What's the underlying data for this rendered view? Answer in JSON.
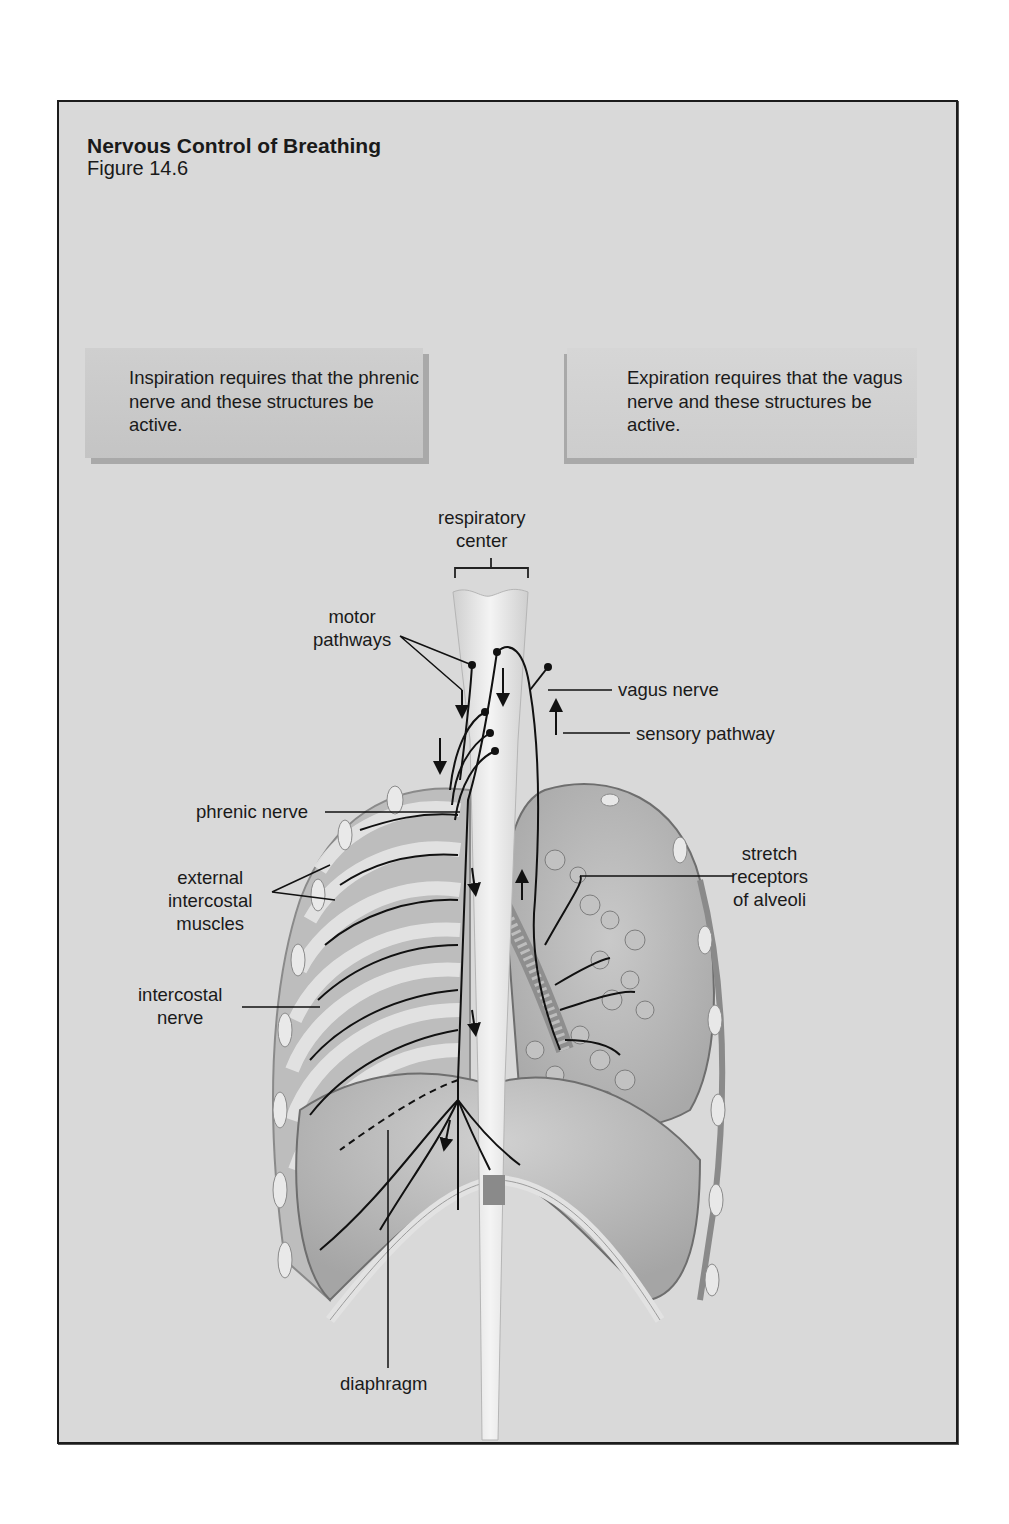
{
  "figure": {
    "title": "Nervous Control of Breathing",
    "subtitle": "Figure 14.6"
  },
  "callouts": {
    "inspiration": "Inspiration requires that the phrenic nerve and these structures be active.",
    "expiration": "Expiration requires that the vagus nerve and these structures be active."
  },
  "labels": {
    "respiratory_center": [
      "respiratory",
      "center"
    ],
    "motor_pathways": [
      "motor",
      "pathways"
    ],
    "vagus_nerve": "vagus nerve",
    "sensory_pathway": "sensory pathway",
    "phrenic_nerve": "phrenic nerve",
    "stretch_receptors": [
      "stretch",
      "receptors",
      "of alveoli"
    ],
    "external_intercostal_muscles": [
      "external",
      "intercostal",
      "muscles"
    ],
    "intercostal_nerve": [
      "intercostal",
      "nerve"
    ],
    "diaphragm": "diaphragm"
  },
  "colors": {
    "frame_background": "#d9d9d9",
    "frame_border": "#1c1c1c",
    "callout_fill": "#c8c8c8",
    "callout_shadow": "#a9a9a9",
    "nerve_line": "#111111"
  }
}
